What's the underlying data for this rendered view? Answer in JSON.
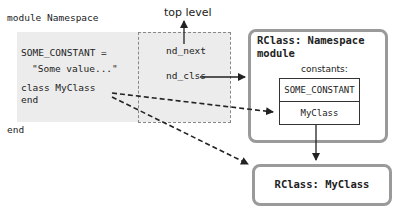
{
  "code": {
    "line_module": "module Namespace",
    "line_const": "SOME_CONSTANT =",
    "line_value": "\"Some value...\"",
    "line_class": "class MyClass",
    "line_end_inner": "end",
    "line_end_outer": "end"
  },
  "scope": {
    "top_level_label": "top level",
    "nd_next": "nd_next",
    "nd_clss": "nd_clss"
  },
  "namespace_rclass": {
    "title_line1": "RClass: Namespace",
    "title_line2": "module",
    "constants_label": "constants:",
    "constants": [
      "SOME_CONSTANT",
      "MyClass"
    ]
  },
  "myclass_rclass": {
    "title": "RClass: MyClass"
  },
  "colors": {
    "box_border": "#9a9a9a",
    "code_bg": "#ececec",
    "arrow": "#222222"
  }
}
